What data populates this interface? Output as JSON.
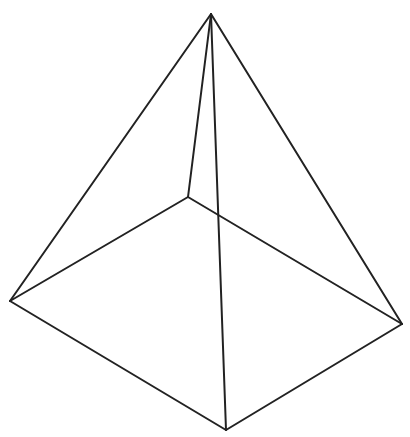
{
  "diagram": {
    "title": "",
    "type": "square-pyramid-wireframe",
    "stroke_color": "#222222",
    "stroke_width": 2,
    "background": "#ffffff",
    "vertices": {
      "apex": [
        211,
        14
      ],
      "base_left": [
        10,
        301
      ],
      "base_back": [
        188,
        197
      ],
      "base_right": [
        402,
        324
      ],
      "base_front": [
        226,
        430
      ]
    },
    "edges": [
      {
        "name": "apex-to-base-left",
        "from": "apex",
        "to": "base_left"
      },
      {
        "name": "apex-to-base-back",
        "from": "apex",
        "to": "base_back"
      },
      {
        "name": "apex-to-base-right",
        "from": "apex",
        "to": "base_right"
      },
      {
        "name": "apex-to-base-front",
        "from": "apex",
        "to": "base_front"
      },
      {
        "name": "base-left-to-base-back",
        "from": "base_left",
        "to": "base_back"
      },
      {
        "name": "base-back-to-base-right",
        "from": "base_back",
        "to": "base_right"
      },
      {
        "name": "base-right-to-base-front",
        "from": "base_right",
        "to": "base_front"
      },
      {
        "name": "base-front-to-base-left",
        "from": "base_front",
        "to": "base_left"
      }
    ]
  }
}
